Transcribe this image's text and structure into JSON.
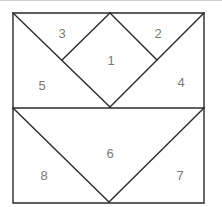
{
  "diagram": {
    "type": "quilt-block-piecing-diagram",
    "stroke_color": "#2a2a2a",
    "label_color": "#7a7a7a",
    "outer_square": {
      "x1": 13,
      "y1": 13,
      "x2": 204,
      "y2": 203
    },
    "midline_y": 108,
    "vertices": {
      "top_apex": [
        110,
        13
      ],
      "diamond_left": [
        62,
        60
      ],
      "diamond_right": [
        157,
        60
      ],
      "diamond_bottom": [
        110,
        107
      ],
      "bottom_apex": [
        109,
        202
      ]
    },
    "pieces": [
      {
        "id": "1",
        "label": "1",
        "shape": "diamond (center square on point)",
        "label_pos": [
          111,
          60
        ]
      },
      {
        "id": "2",
        "label": "2",
        "shape": "top-right small triangle",
        "label_pos": [
          158,
          33
        ]
      },
      {
        "id": "3",
        "label": "3",
        "shape": "top-left small triangle",
        "label_pos": [
          62,
          33
        ]
      },
      {
        "id": "4",
        "label": "4",
        "shape": "right large triangle (upper half)",
        "label_pos": [
          181,
          82
        ]
      },
      {
        "id": "5",
        "label": "5",
        "shape": "left large triangle (upper half)",
        "label_pos": [
          42,
          85
        ]
      },
      {
        "id": "6",
        "label": "6",
        "shape": "inverted center triangle (lower half)",
        "label_pos": [
          110,
          153
        ]
      },
      {
        "id": "7",
        "label": "7",
        "shape": "bottom-right triangle",
        "label_pos": [
          180,
          175
        ]
      },
      {
        "id": "8",
        "label": "8",
        "shape": "bottom-left triangle",
        "label_pos": [
          44,
          175
        ]
      }
    ]
  }
}
